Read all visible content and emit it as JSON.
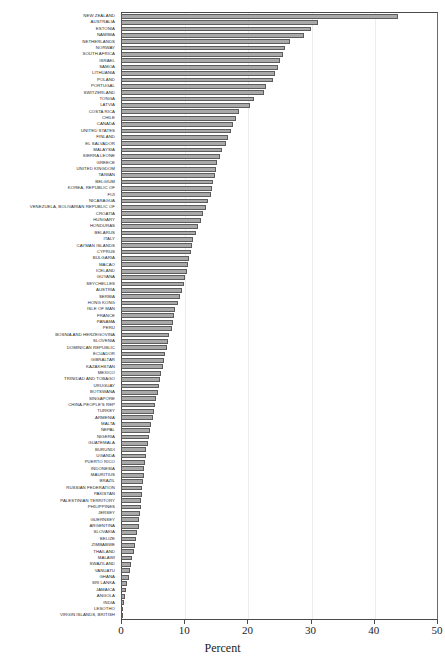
{
  "header": {
    "fragment_text": " "
  },
  "chart_data": {
    "type": "bar",
    "orientation": "horizontal",
    "title": "",
    "xlabel": "Percent",
    "ylabel": "",
    "xlim": [
      0,
      50
    ],
    "xticks": [
      0,
      10,
      20,
      30,
      40,
      50
    ],
    "xtick_labels": [
      "0",
      "10",
      "20",
      "30",
      "40",
      "50"
    ],
    "grid": false,
    "legend": false,
    "bar_color": "#a9a9a9",
    "bar_edge_color": "#5c5c5c",
    "categories": [
      "NEW ZEALAND",
      "AUSTRALIA",
      "ESTONIA",
      "NAMIBIA",
      "NETHERLANDS",
      "NORWAY",
      "SOUTH AFRICA",
      "ISRAEL",
      "SAMOA",
      "LITHUANIA",
      "POLAND",
      "PORTUGAL",
      "SWITZERLAND",
      "TONGA",
      "LATVIA",
      "COSTA RICA",
      "CHILE",
      "CANADA",
      "UNITED STATES",
      "FINLAND",
      "EL SALVADOR",
      "MALAYSIA",
      "SIERRA LEONE",
      "GREECE",
      "UNITED KINGDOM",
      "TAIWAN",
      "BELGIUM",
      "KOREA, REPUBLIC OF",
      "FIJI",
      "NICARAGUA",
      "VENEZUELA, BOLIVARIAN REPUBLIC OF",
      "CROATIA",
      "HUNGARY",
      "HONDURAS",
      "BELARUS",
      "ITALY",
      "CAYMAN ISLANDS",
      "CYPRUS",
      "BULGARIA",
      "MACAO",
      "ICELAND",
      "GUYANA",
      "SEYCHELLES",
      "AUSTRIA",
      "SERBIA",
      "HONG KONG",
      "ISLE OF MAN",
      "FRANCE",
      "PANAMA",
      "PERU",
      "BOSNIA AND HERZEGOVINA",
      "SLOVENIA",
      "DOMINICAN REPUBLIC",
      "ECUADOR",
      "GIBRALTAR",
      "KAZAKHSTAN",
      "MEXICO",
      "TRINIDAD AND TOBAGO",
      "URUGUAY",
      "BOTSWANA",
      "SINGAPORE",
      "CHINA-PEOPLE'S REP",
      "TURKEY",
      "ARMENIA",
      "MALTA",
      "NEPAL",
      "NIGERIA",
      "GUATEMALA",
      "BURUNDI",
      "UGANDA",
      "PUERTO RICO",
      "INDONESIA",
      "MAURITIUS",
      "BRAZIL",
      "RUSSIAN FEDERATION",
      "PAKISTAN",
      "PALESTINIAN TERRITORY",
      "PHILIPPINES",
      "JERSEY",
      "GUERNSEY",
      "ARGENTINA",
      "SLOVAKIA",
      "BELIZE",
      "ZIMBABWE",
      "THAILAND",
      "MALAWI",
      "SWAZILAND",
      "VANUATU",
      "GHANA",
      "SRI LANKA",
      "JAMAICA",
      "ANGOLA",
      "INDIA",
      "LESOTHO",
      "VIRGIN ISLANDS, BRITISH"
    ],
    "values": [
      43.8,
      31.2,
      30.0,
      29.0,
      26.8,
      26.0,
      25.6,
      25.2,
      24.8,
      24.4,
      24.0,
      23.0,
      22.6,
      21.0,
      20.4,
      18.6,
      18.2,
      17.8,
      17.4,
      17.0,
      16.6,
      16.0,
      15.6,
      15.2,
      15.0,
      14.8,
      14.6,
      14.4,
      14.2,
      13.8,
      13.4,
      13.0,
      12.6,
      12.2,
      11.8,
      11.4,
      11.2,
      11.0,
      10.8,
      10.6,
      10.4,
      10.2,
      10.0,
      9.6,
      9.4,
      9.0,
      8.6,
      8.4,
      8.2,
      8.0,
      7.6,
      7.4,
      7.2,
      7.0,
      6.8,
      6.6,
      6.4,
      6.2,
      6.0,
      5.8,
      5.6,
      5.4,
      5.2,
      5.0,
      4.8,
      4.6,
      4.4,
      4.2,
      4.0,
      3.9,
      3.8,
      3.7,
      3.6,
      3.5,
      3.4,
      3.3,
      3.2,
      3.1,
      3.0,
      2.9,
      2.8,
      2.6,
      2.4,
      2.2,
      2.0,
      1.8,
      1.6,
      1.4,
      1.2,
      1.0,
      0.8,
      0.6,
      0.4,
      0.2,
      0.1
    ]
  }
}
